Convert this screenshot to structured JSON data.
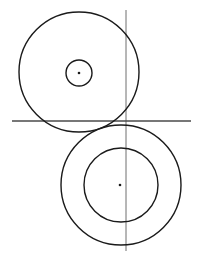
{
  "diagram": {
    "width": 198,
    "height": 259,
    "background": "#ffffff",
    "stroke_color": "#1a1a1a",
    "line_color": "#6e6e6e",
    "upper_outer_circle": {
      "cx": 79,
      "cy": 72,
      "r": 60
    },
    "upper_inner_circle": {
      "cx": 79,
      "cy": 73,
      "r": 13
    },
    "upper_center_point": {
      "cx": 79,
      "cy": 73,
      "r": 1.3
    },
    "lower_outer_circle": {
      "cx": 121,
      "cy": 185,
      "r": 60
    },
    "lower_inner_circle": {
      "cx": 121,
      "cy": 185,
      "r": 37
    },
    "lower_center_point": {
      "cx": 120,
      "cy": 185,
      "r": 1.3
    },
    "horizontal_line": {
      "x1": 12,
      "y1": 121,
      "x2": 191,
      "y2": 121
    },
    "vertical_line": {
      "x1": 126,
      "y1": 10,
      "x2": 126,
      "y2": 251
    }
  }
}
